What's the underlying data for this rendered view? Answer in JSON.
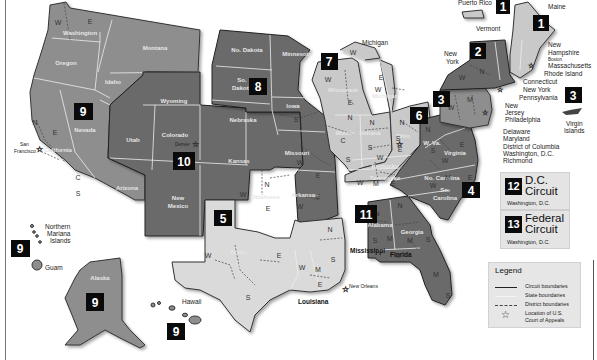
{
  "map": {
    "title": "U.S. Courts of Appeals and U.S. District Courts — Geographic Boundaries",
    "colors": {
      "light_gray": "#c9c9c9",
      "medium_gray": "#8e8e8e",
      "dark_gray": "#6b6b6b",
      "badge": "#0a0a0a",
      "background": "#ffffff"
    },
    "circuits": [
      {
        "number": "1",
        "states": [
          "Maine",
          "New Hampshire",
          "Massachusetts",
          "Rhode Island",
          "Puerto Rico"
        ],
        "court_location": "Boston"
      },
      {
        "number": "2",
        "states": [
          "New York",
          "Vermont",
          "Connecticut"
        ],
        "court_location": "New York"
      },
      {
        "number": "3",
        "states": [
          "Pennsylvania",
          "New Jersey",
          "Delaware",
          "Virgin Islands"
        ],
        "court_location": "Philadelphia"
      },
      {
        "number": "4",
        "states": [
          "Maryland",
          "West Virginia",
          "Virginia",
          "North Carolina",
          "South Carolina"
        ],
        "court_location": "Richmond"
      },
      {
        "number": "5",
        "states": [
          "Texas",
          "Louisiana",
          "Mississippi"
        ],
        "court_location": "New Orleans"
      },
      {
        "number": "6",
        "states": [
          "Michigan",
          "Ohio",
          "Kentucky",
          "Tennessee"
        ],
        "court_location": "Cincinnati"
      },
      {
        "number": "7",
        "states": [
          "Wisconsin",
          "Illinois",
          "Indiana"
        ],
        "court_location": "Chicago"
      },
      {
        "number": "8",
        "states": [
          "North Dakota",
          "South Dakota",
          "Nebraska",
          "Minnesota",
          "Iowa",
          "Missouri",
          "Arkansas"
        ],
        "court_location": "St. Louis"
      },
      {
        "number": "9",
        "states": [
          "Washington",
          "Oregon",
          "California",
          "Nevada",
          "Idaho",
          "Montana",
          "Arizona",
          "Alaska",
          "Hawaii",
          "Guam",
          "Northern Mariana Islands"
        ],
        "court_location": "San Francisco"
      },
      {
        "number": "10",
        "states": [
          "Wyoming",
          "Utah",
          "Colorado",
          "Kansas",
          "New Mexico",
          "Oklahoma"
        ],
        "court_location": "Denver"
      },
      {
        "number": "11",
        "states": [
          "Alabama",
          "Georgia",
          "Florida"
        ],
        "court_location": "Atlanta"
      }
    ],
    "state_labels": {
      "washington": "Washington",
      "oregon": "Oregon",
      "idaho": "Idaho",
      "montana": "Montana",
      "nevada": "Nevada",
      "california": "California",
      "arizona": "Arizona",
      "utah": "Utah",
      "wyoming": "Wyoming",
      "colorado": "Colorado",
      "new_mexico": "New Mexico",
      "kansas": "Kansas",
      "oklahoma": "Oklahoma",
      "texas": "Texas",
      "no_dakota": "No. Dakota",
      "so_dakota_1": "So.",
      "so_dakota_2": "Dakota",
      "nebraska": "Nebraska",
      "minnesota": "Minnesota",
      "iowa": "Iowa",
      "missouri": "Missouri",
      "arkansas": "Arkansas",
      "wisconsin": "Wisconsin",
      "illinois": "Illinois",
      "indiana": "Indiana",
      "michigan_lower": "Michigan",
      "ohio": "Ohio",
      "kentucky": "Kentucky",
      "tennessee": "Tennessee",
      "w_va": "W. Va.",
      "virginia": "Virginia",
      "no_carolina": "No. Carolina",
      "so_carolina_1": "So.",
      "so_carolina_2": "Carolina",
      "alabama": "Alabama",
      "georgia": "Georgia",
      "alaska": "Alaska",
      "new_mexico_1": "New",
      "new_mexico_2": "Mexico"
    },
    "city_labels": {
      "denver": "Denver",
      "san_francisco_1": "San",
      "san_francisco_2": "Francisco",
      "chicago": "Chicago",
      "st_louis": "St. Louis",
      "cincinnati": "Cincinnati",
      "atlanta": "Atlanta"
    },
    "external_labels": {
      "puerto_rico": "Puerto Rico",
      "maine": "Maine",
      "vermont": "Vermont",
      "new_york_1": "New",
      "new_york_2": "York",
      "new_hampshire_1": "New",
      "new_hampshire_2": "Hampshire",
      "boston": "Boston",
      "massachusetts": "Massachusetts",
      "rhode_island": "Rhode Island",
      "connecticut": "Connecticut",
      "new_york_city": "New York",
      "pennsylvania": "Pennsylvania",
      "new_jersey_1": "New",
      "new_jersey_2": "Jersey",
      "philadelphia": "Philadelphia",
      "delaware": "Delaware",
      "maryland": "Maryland",
      "district_of_columbia": "District of Columbia",
      "washington_dc": "Washington, D.C.",
      "richmond": "Richmond",
      "virgin_islands_1": "Virgin",
      "virgin_islands_2": "Islands",
      "michigan": "Michigan",
      "mississippi": "Mississippi",
      "louisiana": "Louisiana",
      "new_orleans": "New Orleans",
      "florida": "Florida",
      "hawaii": "Hawaii",
      "guam": "Guam",
      "northern_mariana_1": "Northern",
      "northern_mariana_2": "Mariana",
      "northern_mariana_3": "Islands"
    },
    "badges": {
      "c1_pr": "1",
      "c1_me": "1",
      "c2": "2",
      "c3": "3",
      "c3_vi": "3",
      "c4": "4",
      "c5": "5",
      "c6": "6",
      "c7": "7",
      "c8": "8",
      "c9_main": "9",
      "c9_nmi": "9",
      "c9_ak": "9",
      "c9_hi": "9",
      "c10": "10",
      "c11": "11"
    },
    "district_letters": {
      "N": "N",
      "S": "S",
      "E": "E",
      "W": "W",
      "C": "C",
      "M": "M"
    }
  },
  "special_courts": [
    {
      "number": "12",
      "title_line1": "D.C.",
      "title_line2": "Circuit",
      "location": "Washington, D.C."
    },
    {
      "number": "13",
      "title_line1": "Federal",
      "title_line2": "Circuit",
      "location": "Washington, D.C."
    }
  ],
  "legend": {
    "title": "Legend",
    "items": [
      {
        "symbol": "solid-line",
        "label": "Circuit boundaries"
      },
      {
        "symbol": "thin-line",
        "label": "State boundaries"
      },
      {
        "symbol": "dashed-line",
        "label": "District boundaries"
      },
      {
        "symbol": "star",
        "label_line1": "Location of U.S.",
        "label_line2": "Court of Appeals"
      }
    ]
  }
}
